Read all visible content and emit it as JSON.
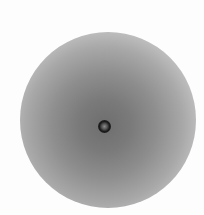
{
  "image": {
    "description": "Grayscale circular gradient disc with a small dark ring at the center",
    "colors": {
      "background": "#fdfdfd",
      "disc_center": "#6e6e6e",
      "disc_edge": "#f6f6f6",
      "center_ring": "#1a1a1a"
    }
  }
}
